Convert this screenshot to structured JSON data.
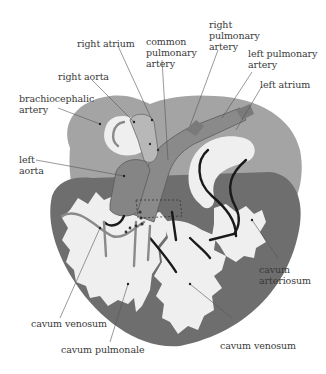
{
  "diagram": {
    "colors": {
      "atria": "#a4a4a4",
      "ventricle": "#6e6e6e",
      "cavity": "#efefef",
      "vessel": "#8a8a8a",
      "flow_arrow": "#1a1a1a",
      "leader_line": "#555555",
      "label_text": "#3a3a3a"
    },
    "labels": {
      "right_atrium": "right atrium",
      "common_pulmonary_artery": "common\npulmonary\nartery",
      "right_pulmonary_artery": "right\npulmonary\nartery",
      "left_pulmonary_artery": "left pulmonary\nartery",
      "left_atrium": "left atrium",
      "right_aorta": "right aorta",
      "brachiocephalic_artery": "brachiocephalic\nartery",
      "left_aorta": "left\naorta",
      "cavum_arteriosum": "cavum\narteriosum",
      "cavum_venosum_left": "cavum venosum",
      "cavum_pulmonale": "cavum pulmonale",
      "cavum_venosum_right": "cavum venosum"
    }
  }
}
